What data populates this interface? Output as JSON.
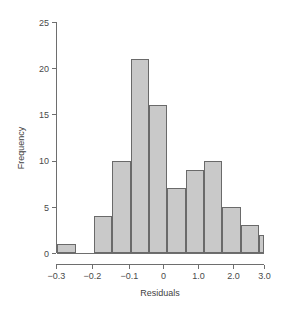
{
  "chart_data": {
    "type": "bar",
    "subtype": "histogram",
    "title": "",
    "xlabel": "Residuals",
    "ylabel": "Frequency",
    "grid": false,
    "legend": null,
    "ylim": [
      0,
      25
    ],
    "y_ticks": [
      0,
      5,
      10,
      15,
      20,
      25
    ],
    "y_tick_labels": [
      "0",
      "5",
      "10",
      "15",
      "20",
      "25"
    ],
    "x_tick_labels": [
      "−0.3",
      "−0.2",
      "−0.1",
      "0",
      "1.0",
      "2.0",
      "3.0"
    ],
    "x_tick_positions_px": [
      56,
      92,
      129,
      163,
      198,
      233,
      264
    ],
    "note": "x axis tick spacing is non-linear as drawn; bins are equal width in pixels",
    "bin_count": 13,
    "bin_labels": [
      "bin-1",
      "bin-2",
      "bin-3",
      "bin-4",
      "bin-5",
      "bin-6",
      "bin-7",
      "bin-8",
      "bin-9",
      "bin-10",
      "bin-11",
      "bin-12",
      "bin-13"
    ],
    "bars": [
      {
        "index": 0,
        "x_left_px": 57,
        "x_right_px": 76,
        "value": 1
      },
      {
        "index": 1,
        "x_left_px": 76,
        "x_right_px": 94,
        "value": 0
      },
      {
        "index": 2,
        "x_left_px": 94,
        "x_right_px": 112,
        "value": 4
      },
      {
        "index": 3,
        "x_left_px": 112,
        "x_right_px": 131,
        "value": 10
      },
      {
        "index": 4,
        "x_left_px": 131,
        "x_right_px": 149,
        "value": 21
      },
      {
        "index": 5,
        "x_left_px": 149,
        "x_right_px": 167,
        "value": 16
      },
      {
        "index": 6,
        "x_left_px": 167,
        "x_right_px": 186,
        "value": 7
      },
      {
        "index": 7,
        "x_left_px": 186,
        "x_right_px": 204,
        "value": 9
      },
      {
        "index": 8,
        "x_left_px": 204,
        "x_right_px": 222,
        "value": 10
      },
      {
        "index": 9,
        "x_left_px": 222,
        "x_right_px": 241,
        "value": 5
      },
      {
        "index": 10,
        "x_left_px": 241,
        "x_right_px": 259,
        "value": 3
      },
      {
        "index": 11,
        "x_left_px": 259,
        "x_right_px": 264,
        "value": 2
      }
    ],
    "values": [
      1,
      0,
      4,
      10,
      21,
      16,
      7,
      9,
      10,
      5,
      3,
      2
    ],
    "colors": {
      "bar_fill": "#c9c9c9",
      "bar_stroke": "#6a6a6a",
      "axis": "#6e6e6e",
      "text": "#4a4a4a",
      "background": "#ffffff"
    }
  },
  "plot_geometry": {
    "baseline_y_px": 253,
    "top_y_px": 22,
    "axis_x_px": 56,
    "axis_right_px": 264
  }
}
